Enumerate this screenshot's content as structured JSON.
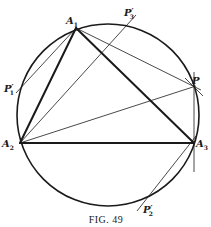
{
  "figure": {
    "caption": "Fig. 49",
    "caption_display": "FIG. 49",
    "stroke_color": "#1a1a1a",
    "background": "#ffffff",
    "circle": {
      "cx": 108,
      "cy": 115,
      "r": 91
    },
    "points": {
      "A1": {
        "x": 76,
        "y": 28,
        "label": "A",
        "sub": "1",
        "prime": "",
        "lx": 66,
        "ly": 24
      },
      "A2": {
        "x": 20,
        "y": 143,
        "label": "A",
        "sub": "2",
        "prime": "",
        "lx": 2,
        "ly": 147
      },
      "A3": {
        "x": 194,
        "y": 143,
        "label": "A",
        "sub": "3",
        "prime": "",
        "lx": 196,
        "ly": 147
      },
      "P": {
        "x": 194,
        "y": 87,
        "label": "P",
        "sub": "",
        "prime": "",
        "lx": 192,
        "ly": 84
      },
      "P1p": {
        "x": 18,
        "y": 88,
        "label": "P",
        "sub": "1",
        "prime": "′",
        "lx": 4,
        "ly": 92
      },
      "P2p": {
        "x": 143,
        "y": 203,
        "label": "P",
        "sub": "2",
        "prime": "′",
        "lx": 143,
        "ly": 213
      },
      "P3p": {
        "x": 131,
        "y": 22,
        "label": "P",
        "sub": "3",
        "prime": "′",
        "lx": 124,
        "ly": 16
      }
    },
    "thick_lines": [
      {
        "from": "A1",
        "to": "A2"
      },
      {
        "from": "A1",
        "to": "A3"
      },
      {
        "from": "A2",
        "to": "A3"
      }
    ],
    "thin_lines": [
      {
        "x1": 76,
        "y1": 28,
        "x2": 16,
        "y2": 93
      },
      {
        "x1": 20,
        "y1": 143,
        "x2": 136,
        "y2": 15
      },
      {
        "x1": 76,
        "y1": 28,
        "x2": 201,
        "y2": 90
      },
      {
        "x1": 20,
        "y1": 143,
        "x2": 196,
        "y2": 86
      },
      {
        "x1": 194,
        "y1": 72,
        "x2": 194,
        "y2": 172
      },
      {
        "x1": 196,
        "y1": 136,
        "x2": 137,
        "y2": 211
      },
      {
        "x1": 185,
        "y1": 78,
        "x2": 203,
        "y2": 96
      }
    ]
  }
}
